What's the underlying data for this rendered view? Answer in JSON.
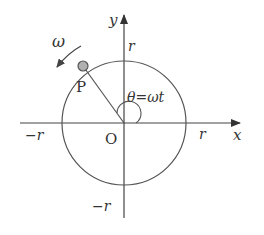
{
  "diagram": {
    "colors": {
      "stroke": "#444444",
      "text": "#333333",
      "point_fill": "#b0b0b0",
      "background": "#ffffff"
    },
    "axes": {
      "x_label": "x",
      "y_label": "y",
      "origin_label": "O"
    },
    "ticks": {
      "x_pos": "r",
      "x_neg": "−r",
      "y_pos": "r",
      "y_neg": "−r"
    },
    "point": {
      "label": "P"
    },
    "angular_velocity_label": "ω",
    "angle_label": "θ=ωt"
  }
}
